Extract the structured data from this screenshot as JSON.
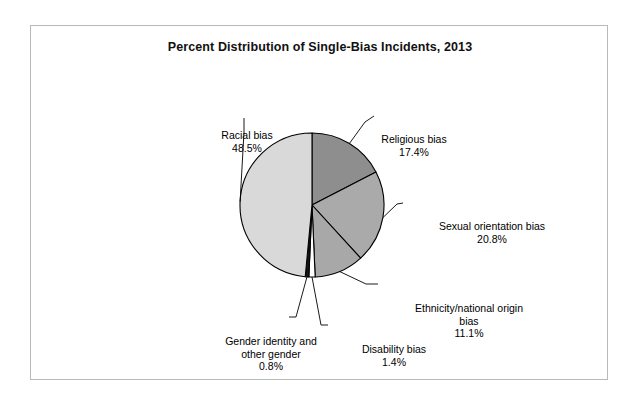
{
  "chart_data": {
    "type": "pie",
    "title": "Percent Distribution of Single-Bias Incidents, 2013",
    "xlabel": "",
    "ylabel": "",
    "legend": "none",
    "grid": false,
    "value_suffix": "%",
    "start_angle_deg": 0,
    "direction": "clockwise",
    "categories": [
      "Religious bias",
      "Sexual orientation bias",
      "Ethnicity/national origin bias",
      "Disability bias",
      "Gender identity and other gender",
      "Racial bias"
    ],
    "values": [
      17.4,
      20.8,
      11.1,
      1.4,
      0.8,
      48.5
    ],
    "slices": [
      {
        "name": "Religious bias",
        "value": 17.4,
        "value_text": "17.4%",
        "color": "#8e8e8e"
      },
      {
        "name": "Sexual orientation bias",
        "value": 20.8,
        "value_text": "20.8%",
        "color": "#aaaaaa"
      },
      {
        "name": "Ethnicity/national origin bias",
        "value": 11.1,
        "value_text": "11.1%",
        "color": "#a8a8a8"
      },
      {
        "name": "Disability bias",
        "value": 1.4,
        "value_text": "1.4%",
        "color": "#ffffff"
      },
      {
        "name": "Gender identity and other gender",
        "value": 0.8,
        "value_text": "0.8%",
        "color": "#151515"
      },
      {
        "name": "Racial bias",
        "value": 48.5,
        "value_text": "48.5%",
        "color": "#d9d9d9"
      }
    ]
  },
  "labels": {
    "racial": {
      "line1": "Racial bias",
      "line2": "48.5%"
    },
    "religious": {
      "line1": "Religious bias",
      "line2": "17.4%"
    },
    "sexual": {
      "line1": "Sexual orientation bias",
      "line2": "20.8%"
    },
    "ethnicity": {
      "line1": "Ethnicity/national origin",
      "line2": "bias",
      "line3": "11.1%"
    },
    "gender_identity": {
      "line1": "Gender identity and",
      "line2": "other gender",
      "line3": "0.8%"
    },
    "disability": {
      "line1": "Disability bias",
      "line2": "1.4%"
    }
  }
}
